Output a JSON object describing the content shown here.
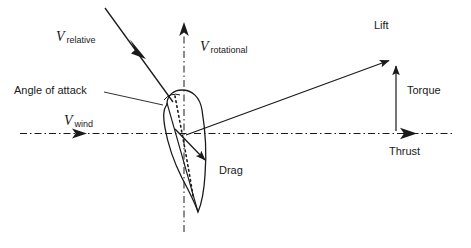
{
  "diagram": {
    "stroke_color": "#1a1a1a",
    "background_color": "#ffffff",
    "labels": {
      "v_relative_symbol": "V",
      "v_relative_subscript": "relative",
      "v_rotational_symbol": "V",
      "v_rotational_subscript": "rotational",
      "v_wind_symbol": "V",
      "v_wind_subscript": "wind",
      "angle_of_attack": "Angle of attack",
      "lift": "Lift",
      "torque": "Torque",
      "thrust": "Thrust",
      "drag": "Drag"
    },
    "vectors": [
      {
        "name": "v-relative",
        "label": "V relative",
        "x1": 105,
        "y1": 8,
        "x2": 172,
        "y2": 101,
        "style": "solid",
        "arrow": "mid"
      },
      {
        "name": "v-rotational",
        "label": "V rotational",
        "x1": 184,
        "y1": 132,
        "x2": 184,
        "y2": 26,
        "style": "dash-dot",
        "arrow": "end"
      },
      {
        "name": "v-wind",
        "label": "V wind",
        "x1": 20,
        "y1": 133,
        "x2": 450,
        "y2": 133,
        "style": "dash-dot",
        "arrow": "mid-and-end"
      },
      {
        "name": "lift",
        "label": "Lift",
        "x1": 188,
        "y1": 134,
        "x2": 394,
        "y2": 58,
        "style": "solid",
        "arrow": "end"
      },
      {
        "name": "torque",
        "label": "Torque",
        "x1": 396,
        "y1": 130,
        "x2": 396,
        "y2": 60,
        "style": "solid",
        "arrow": "end"
      },
      {
        "name": "thrust",
        "label": "Thrust",
        "x1": 20,
        "y1": 133,
        "x2": 418,
        "y2": 133,
        "style": "dash-dot",
        "arrow": "end"
      },
      {
        "name": "drag",
        "label": "Drag",
        "x1": 176,
        "y1": 130,
        "x2": 211,
        "y2": 166,
        "style": "solid",
        "arrow": "end"
      }
    ]
  }
}
